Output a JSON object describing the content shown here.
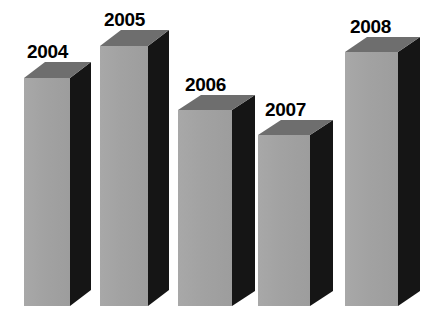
{
  "chart_data": {
    "type": "bar",
    "title": "",
    "subtitle": "",
    "xlabel": "",
    "ylabel": "",
    "grid": false,
    "legend": false,
    "style": "3d-extruded-bars",
    "categories": [
      "2004",
      "2005",
      "2006",
      "2007",
      "2008"
    ],
    "values": [
      89,
      100,
      76,
      68,
      98
    ],
    "ylim": [
      0,
      100
    ],
    "value_unit": "relative bar height (%)",
    "annotations": [
      "2004",
      "2005",
      "2006",
      "2007",
      "2008"
    ]
  },
  "colors": {
    "background": "#ffffff",
    "bar_front": "#a2a2a2",
    "bar_top": "#6e6e6e",
    "bar_side": "#151515",
    "label_text": "#000000"
  },
  "bars": [
    {
      "label": "2004",
      "value": 89,
      "front_left": 24,
      "front_right": 70,
      "front_top": 78,
      "bottom": 306,
      "depth_x": 21,
      "depth_y": 16,
      "label_x": 27,
      "label_y": 42
    },
    {
      "label": "2005",
      "value": 100,
      "front_left": 100,
      "front_right": 148,
      "front_top": 46,
      "bottom": 306,
      "depth_x": 21,
      "depth_y": 16,
      "label_x": 104,
      "label_y": 10
    },
    {
      "label": "2006",
      "value": 76,
      "front_left": 178,
      "front_right": 232,
      "front_top": 110,
      "bottom": 306,
      "depth_x": 23,
      "depth_y": 15,
      "label_x": 185,
      "label_y": 75
    },
    {
      "label": "2007",
      "value": 68,
      "front_left": 258,
      "front_right": 310,
      "front_top": 135,
      "bottom": 306,
      "depth_x": 23,
      "depth_y": 15,
      "label_x": 265,
      "label_y": 100
    },
    {
      "label": "2008",
      "value": 98,
      "front_left": 345,
      "front_right": 398,
      "front_top": 52,
      "bottom": 306,
      "depth_x": 22,
      "depth_y": 15,
      "label_x": 350,
      "label_y": 17
    }
  ]
}
